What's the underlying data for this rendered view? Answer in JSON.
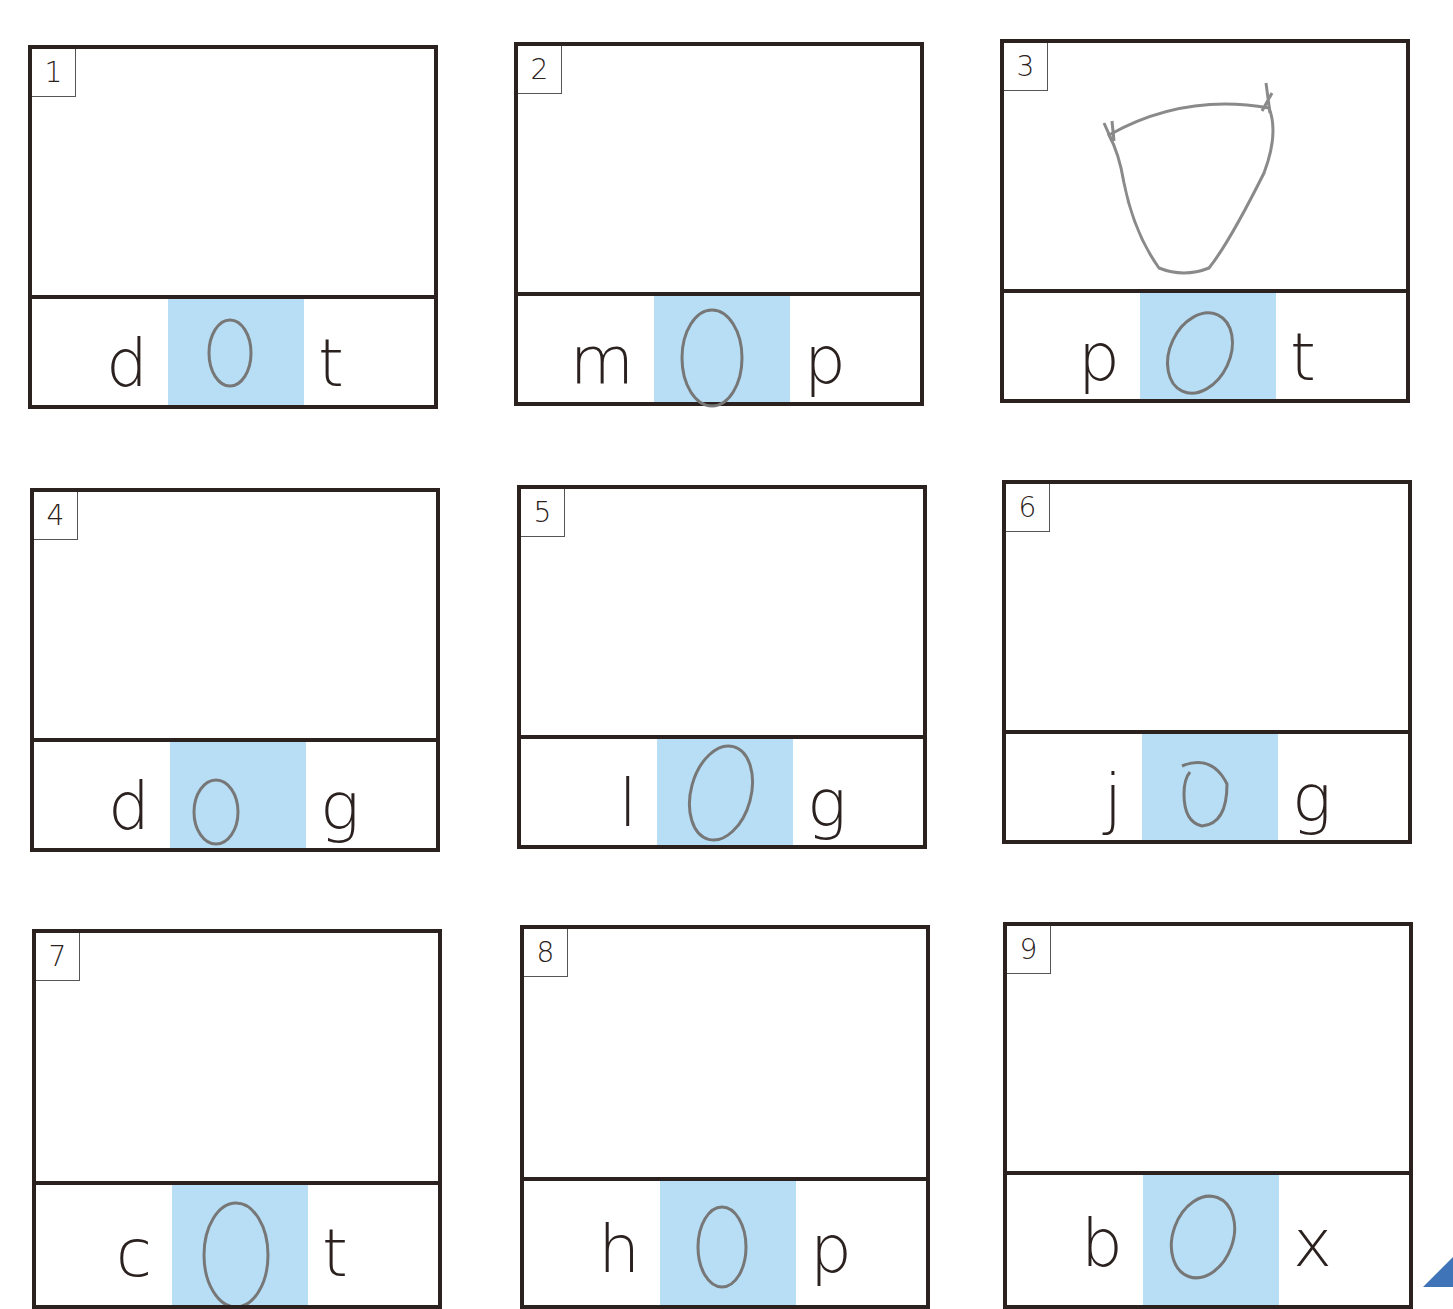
{
  "worksheet": {
    "title": "CVC short o words",
    "colors": {
      "border": "#2b2220",
      "vowel_highlight": "#b7def4",
      "pencil": "#777777"
    },
    "cards": [
      {
        "number": "1",
        "first": "d",
        "vowel": "o",
        "last": "t",
        "word": "dot",
        "vowel_circled": true,
        "drawing": ""
      },
      {
        "number": "2",
        "first": "m",
        "vowel": "o",
        "last": "p",
        "word": "mop",
        "vowel_circled": true,
        "drawing": ""
      },
      {
        "number": "3",
        "first": "p",
        "vowel": "o",
        "last": "t",
        "word": "pot",
        "vowel_circled": true,
        "drawing": "pot sketch"
      },
      {
        "number": "4",
        "first": "d",
        "vowel": "o",
        "last": "g",
        "word": "dog",
        "vowel_circled": true,
        "drawing": ""
      },
      {
        "number": "5",
        "first": "l",
        "vowel": "o",
        "last": "g",
        "word": "log",
        "vowel_circled": true,
        "drawing": ""
      },
      {
        "number": "6",
        "first": "j",
        "vowel": "o",
        "last": "g",
        "word": "jog",
        "vowel_circled": true,
        "drawing": ""
      },
      {
        "number": "7",
        "first": "c",
        "vowel": "o",
        "last": "t",
        "word": "cot",
        "vowel_circled": true,
        "drawing": ""
      },
      {
        "number": "8",
        "first": "h",
        "vowel": "o",
        "last": "p",
        "word": "hop",
        "vowel_circled": true,
        "drawing": ""
      },
      {
        "number": "9",
        "first": "b",
        "vowel": "o",
        "last": "x",
        "word": "box",
        "vowel_circled": true,
        "drawing": ""
      }
    ]
  }
}
